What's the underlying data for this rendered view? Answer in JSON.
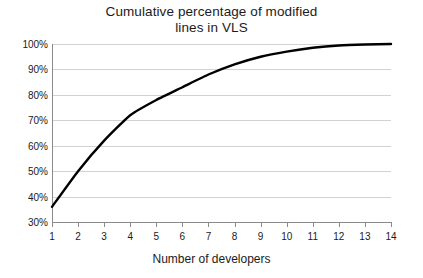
{
  "chart_data": {
    "type": "line",
    "title": "Cumulative percentage of modified lines in VLS",
    "title_lines": [
      "Cumulative percentage of modified",
      "lines in VLS"
    ],
    "xlabel": "Number of developers",
    "ylabel": "",
    "x": [
      1,
      2,
      3,
      4,
      5,
      6,
      7,
      8,
      9,
      10,
      11,
      12,
      13,
      14
    ],
    "values": [
      36,
      50,
      62,
      72,
      78,
      83,
      88,
      92,
      95,
      97,
      98.5,
      99.4,
      99.8,
      100
    ],
    "series": [
      {
        "name": "Cumulative percentage of modified lines",
        "values": [
          36,
          50,
          62,
          72,
          78,
          83,
          88,
          92,
          95,
          97,
          98.5,
          99.4,
          99.8,
          100
        ]
      }
    ],
    "xtick_labels": [
      "1",
      "2",
      "3",
      "4",
      "5",
      "6",
      "7",
      "8",
      "9",
      "10",
      "11",
      "12",
      "13",
      "14"
    ],
    "ytick_labels": [
      "100%",
      "90%",
      "80%",
      "70%",
      "60%",
      "50%",
      "40%",
      "30%"
    ],
    "ytick_values": [
      100,
      90,
      80,
      70,
      60,
      50,
      40,
      30
    ],
    "ylim": [
      30,
      100
    ],
    "xlim": [
      1,
      14
    ],
    "grid": "horizontal",
    "legend": "none",
    "line_color": "#000000",
    "grid_color": "#d2d2d2",
    "axis_color": "#8a8a8a",
    "text_color": "#1b1b1b",
    "background": "#ffffff"
  }
}
